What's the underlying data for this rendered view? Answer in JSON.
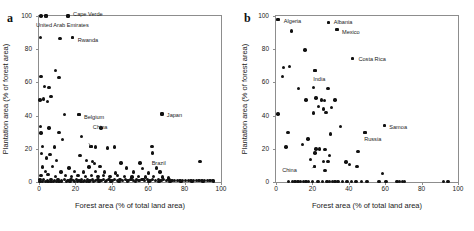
{
  "figure": {
    "panels": [
      {
        "letter": "a",
        "xlabel": "Forest area (% of total land area)",
        "ylabel": "Plantation area (% of forest area)",
        "xticks": [
          "0",
          "20",
          "40",
          "60",
          "80",
          "100"
        ],
        "yticks": [
          "0",
          "20",
          "40",
          "60",
          "80",
          "100"
        ],
        "annotations": [
          {
            "text": "Cape Verde"
          },
          {
            "text": "United Arab Emirates"
          },
          {
            "text": "Rwanda"
          },
          {
            "text": "Belgium"
          },
          {
            "text": "China"
          },
          {
            "text": "Japan"
          },
          {
            "text": "Brazil"
          }
        ]
      },
      {
        "letter": "b",
        "xlabel": "Forest area (% of total land area)",
        "ylabel": "Plantation area (% of forest area)",
        "xticks": [
          "0",
          "20",
          "40",
          "60",
          "80",
          "100"
        ],
        "yticks": [
          "0",
          "20",
          "40",
          "60",
          "80",
          "100"
        ],
        "annotations": [
          {
            "text": "Algeria"
          },
          {
            "text": "Albania"
          },
          {
            "text": "Mexico"
          },
          {
            "text": "Costa Rica"
          },
          {
            "text": "India"
          },
          {
            "text": "Samoa"
          },
          {
            "text": "Russia"
          },
          {
            "text": "China"
          }
        ]
      }
    ]
  },
  "chart_data": [
    {
      "type": "scatter",
      "title": "a",
      "xlabel": "Forest area (% of total land area)",
      "ylabel": "Plantation area (% of forest area)",
      "xlim": [
        0,
        100
      ],
      "ylim": [
        0,
        100
      ],
      "xticks": [
        0,
        20,
        40,
        60,
        80,
        100
      ],
      "yticks": [
        0,
        20,
        40,
        60,
        80,
        100
      ],
      "grid": false,
      "legend": null,
      "marker": "filled-circle",
      "marker_color": "#111111",
      "labeled_points": [
        {
          "label": "Cape Verde",
          "x": 16.0,
          "y": 100.0
        },
        {
          "label": "United Arab Emirates",
          "x": 3.8,
          "y": 100.0
        },
        {
          "label": "Rwanda",
          "x": 18.5,
          "y": 87.0
        },
        {
          "label": "Belgium",
          "x": 22.0,
          "y": 40.5
        },
        {
          "label": "China",
          "x": 28.5,
          "y": 21.5
        },
        {
          "label": "Japan",
          "x": 67.5,
          "y": 41.0
        },
        {
          "label": "Brazil",
          "x": 57.5,
          "y": 1.5
        }
      ],
      "points": [
        [
          1.0,
          100.0
        ],
        [
          3.8,
          100.0
        ],
        [
          16.0,
          100.0
        ],
        [
          0.8,
          87.0
        ],
        [
          11.5,
          86.5
        ],
        [
          18.5,
          87.0
        ],
        [
          1.0,
          63.5
        ],
        [
          11.0,
          63.0
        ],
        [
          9.0,
          67.0
        ],
        [
          3.0,
          57.5
        ],
        [
          5.5,
          57.0
        ],
        [
          2.5,
          50.0
        ],
        [
          6.5,
          51.5
        ],
        [
          0.6,
          49.5
        ],
        [
          4.5,
          48.5
        ],
        [
          14.0,
          40.5
        ],
        [
          22.0,
          40.5
        ],
        [
          67.5,
          41.0
        ],
        [
          0.8,
          33.5
        ],
        [
          5.5,
          32.5
        ],
        [
          11.0,
          30.0
        ],
        [
          1.2,
          29.5
        ],
        [
          23.5,
          27.5
        ],
        [
          34.0,
          32.5
        ],
        [
          13.0,
          25.5
        ],
        [
          2.0,
          21.5
        ],
        [
          8.5,
          21.0
        ],
        [
          28.5,
          21.5
        ],
        [
          31.0,
          21.0
        ],
        [
          37.5,
          20.5
        ],
        [
          41.5,
          21.0
        ],
        [
          62.0,
          21.5
        ],
        [
          1.5,
          17.0
        ],
        [
          6.0,
          16.5
        ],
        [
          22.5,
          16.0
        ],
        [
          62.5,
          17.5
        ],
        [
          4.0,
          14.5
        ],
        [
          9.5,
          13.0
        ],
        [
          26.0,
          13.0
        ],
        [
          29.5,
          12.5
        ],
        [
          30.5,
          11.0
        ],
        [
          45.0,
          11.5
        ],
        [
          55.5,
          11.5
        ],
        [
          88.5,
          12.5
        ],
        [
          2.0,
          9.0
        ],
        [
          7.5,
          9.5
        ],
        [
          16.5,
          8.5
        ],
        [
          27.5,
          9.0
        ],
        [
          33.5,
          9.5
        ],
        [
          48.0,
          8.5
        ],
        [
          57.0,
          8.0
        ],
        [
          64.5,
          8.5
        ],
        [
          3.5,
          6.5
        ],
        [
          12.0,
          6.0
        ],
        [
          19.5,
          6.5
        ],
        [
          24.5,
          6.0
        ],
        [
          31.0,
          6.5
        ],
        [
          36.0,
          6.0
        ],
        [
          42.0,
          5.5
        ],
        [
          52.0,
          6.0
        ],
        [
          60.0,
          5.5
        ],
        [
          66.5,
          6.0
        ],
        [
          1.0,
          4.0
        ],
        [
          5.0,
          4.5
        ],
        [
          9.0,
          3.5
        ],
        [
          14.5,
          4.0
        ],
        [
          18.0,
          3.5
        ],
        [
          21.5,
          4.0
        ],
        [
          25.5,
          3.5
        ],
        [
          29.0,
          4.0
        ],
        [
          32.5,
          3.5
        ],
        [
          35.5,
          4.0
        ],
        [
          39.0,
          3.5
        ],
        [
          43.0,
          4.0
        ],
        [
          47.0,
          3.5
        ],
        [
          51.0,
          3.0
        ],
        [
          54.5,
          3.5
        ],
        [
          58.5,
          3.0
        ],
        [
          63.0,
          3.5
        ],
        [
          68.0,
          3.0
        ],
        [
          71.0,
          2.5
        ],
        [
          0.5,
          1.5
        ],
        [
          2.5,
          1.5
        ],
        [
          4.5,
          1.0
        ],
        [
          6.5,
          1.5
        ],
        [
          8.5,
          1.0
        ],
        [
          10.5,
          1.5
        ],
        [
          12.5,
          1.0
        ],
        [
          14.0,
          1.5
        ],
        [
          16.0,
          1.0
        ],
        [
          17.5,
          1.5
        ],
        [
          19.0,
          1.0
        ],
        [
          20.5,
          1.5
        ],
        [
          22.0,
          1.0
        ],
        [
          23.5,
          1.5
        ],
        [
          25.0,
          1.0
        ],
        [
          26.5,
          1.5
        ],
        [
          28.0,
          1.0
        ],
        [
          29.5,
          1.5
        ],
        [
          31.0,
          1.0
        ],
        [
          32.5,
          1.5
        ],
        [
          34.0,
          1.0
        ],
        [
          35.5,
          1.5
        ],
        [
          37.0,
          1.0
        ],
        [
          38.5,
          1.5
        ],
        [
          40.0,
          1.0
        ],
        [
          41.5,
          1.5
        ],
        [
          43.0,
          1.0
        ],
        [
          44.5,
          1.5
        ],
        [
          46.0,
          1.0
        ],
        [
          47.5,
          1.5
        ],
        [
          49.0,
          1.0
        ],
        [
          50.5,
          1.5
        ],
        [
          52.0,
          1.0
        ],
        [
          53.5,
          1.5
        ],
        [
          55.0,
          1.0
        ],
        [
          56.5,
          1.5
        ],
        [
          57.5,
          1.5
        ],
        [
          58.0,
          1.0
        ],
        [
          59.5,
          1.5
        ],
        [
          61.0,
          1.0
        ],
        [
          62.5,
          1.5
        ],
        [
          64.0,
          1.0
        ],
        [
          65.5,
          1.5
        ],
        [
          67.0,
          1.0
        ],
        [
          68.5,
          1.5
        ],
        [
          70.0,
          1.0
        ],
        [
          71.5,
          1.5
        ],
        [
          73.0,
          1.0
        ],
        [
          74.5,
          0.8
        ],
        [
          76.0,
          1.0
        ],
        [
          77.5,
          0.8
        ],
        [
          79.0,
          1.0
        ],
        [
          80.5,
          0.8
        ],
        [
          82.0,
          1.0
        ],
        [
          83.5,
          0.8
        ],
        [
          85.0,
          1.0
        ],
        [
          86.5,
          0.8
        ],
        [
          88.0,
          1.0
        ],
        [
          89.5,
          0.8
        ],
        [
          91.0,
          1.0
        ],
        [
          92.5,
          0.8
        ],
        [
          94.0,
          1.0
        ],
        [
          95.5,
          0.8
        ],
        [
          0.5,
          0.3
        ],
        [
          2.0,
          0.3
        ],
        [
          3.5,
          0.3
        ],
        [
          5.0,
          0.3
        ],
        [
          6.5,
          0.3
        ],
        [
          8.0,
          0.3
        ],
        [
          9.5,
          0.3
        ],
        [
          11.0,
          0.3
        ],
        [
          12.5,
          0.3
        ],
        [
          15.0,
          0.3
        ],
        [
          17.0,
          0.3
        ],
        [
          19.5,
          0.3
        ],
        [
          21.0,
          0.3
        ],
        [
          23.0,
          0.3
        ],
        [
          24.5,
          0.3
        ],
        [
          26.0,
          0.3
        ],
        [
          27.5,
          0.3
        ],
        [
          30.0,
          0.3
        ],
        [
          33.0,
          0.3
        ],
        [
          36.5,
          0.3
        ],
        [
          39.5,
          0.3
        ],
        [
          44.0,
          0.3
        ],
        [
          48.5,
          0.3
        ],
        [
          53.0,
          0.3
        ],
        [
          60.5,
          0.3
        ],
        [
          66.0,
          0.3
        ],
        [
          72.0,
          0.3
        ],
        [
          78.0,
          0.3
        ],
        [
          84.0,
          0.3
        ],
        [
          90.0,
          0.3
        ],
        [
          96.0,
          0.3
        ]
      ]
    },
    {
      "type": "scatter",
      "title": "b",
      "xlabel": "Forest area (% of total land area)",
      "ylabel": "Plantation area (% of forest area)",
      "xlim": [
        0,
        100
      ],
      "ylim": [
        0,
        100
      ],
      "xticks": [
        0,
        20,
        40,
        60,
        80,
        100
      ],
      "yticks": [
        0,
        20,
        40,
        60,
        80,
        100
      ],
      "grid": false,
      "legend": null,
      "marker": "filled-circle",
      "marker_color": "#111111",
      "labeled_points": [
        {
          "label": "Algeria",
          "x": 1.0,
          "y": 98.0
        },
        {
          "label": "Albania",
          "x": 29.0,
          "y": 96.0
        },
        {
          "label": "Mexico",
          "x": 33.5,
          "y": 92.0
        },
        {
          "label": "Costa Rica",
          "x": 42.0,
          "y": 74.5
        },
        {
          "label": "India",
          "x": 21.5,
          "y": 67.0
        },
        {
          "label": "Samoa",
          "x": 59.5,
          "y": 34.0
        },
        {
          "label": "Russia",
          "x": 49.0,
          "y": 30.0
        },
        {
          "label": "China",
          "x": 21.0,
          "y": 9.5
        }
      ],
      "points": [
        [
          1.0,
          98.0
        ],
        [
          29.0,
          96.0
        ],
        [
          33.5,
          92.0
        ],
        [
          8.5,
          91.0
        ],
        [
          16.0,
          79.5
        ],
        [
          42.0,
          74.5
        ],
        [
          4.0,
          69.0
        ],
        [
          7.5,
          69.5
        ],
        [
          21.5,
          67.0
        ],
        [
          3.5,
          63.5
        ],
        [
          12.5,
          56.5
        ],
        [
          20.5,
          57.0
        ],
        [
          28.5,
          56.5
        ],
        [
          22.0,
          50.5
        ],
        [
          26.5,
          49.0
        ],
        [
          1.0,
          41.0
        ],
        [
          20.5,
          41.5
        ],
        [
          27.5,
          42.0
        ],
        [
          16.5,
          49.5
        ],
        [
          25.0,
          49.5
        ],
        [
          32.5,
          49.5
        ],
        [
          23.5,
          45.5
        ],
        [
          26.0,
          44.0
        ],
        [
          30.5,
          45.0
        ],
        [
          6.5,
          30.0
        ],
        [
          30.0,
          29.0
        ],
        [
          35.5,
          33.5
        ],
        [
          49.0,
          30.0
        ],
        [
          59.5,
          34.0
        ],
        [
          5.5,
          21.0
        ],
        [
          14.5,
          22.5
        ],
        [
          17.5,
          26.0
        ],
        [
          22.0,
          20.0
        ],
        [
          24.0,
          20.0
        ],
        [
          27.0,
          19.5
        ],
        [
          21.5,
          17.5
        ],
        [
          29.5,
          16.0
        ],
        [
          45.0,
          18.5
        ],
        [
          19.0,
          13.5
        ],
        [
          26.0,
          12.5
        ],
        [
          28.5,
          12.5
        ],
        [
          38.5,
          12.0
        ],
        [
          27.0,
          7.0
        ],
        [
          40.5,
          10.5
        ],
        [
          44.5,
          9.5
        ],
        [
          21.0,
          9.5
        ],
        [
          58.5,
          5.0
        ],
        [
          7.0,
          0.3
        ],
        [
          9.0,
          0.3
        ],
        [
          10.5,
          0.3
        ],
        [
          12.0,
          0.3
        ],
        [
          13.5,
          0.3
        ],
        [
          15.0,
          0.3
        ],
        [
          16.5,
          0.3
        ],
        [
          18.0,
          0.3
        ],
        [
          20.0,
          0.3
        ],
        [
          23.0,
          0.3
        ],
        [
          25.5,
          0.3
        ],
        [
          28.0,
          0.3
        ],
        [
          29.5,
          0.3
        ],
        [
          31.0,
          0.3
        ],
        [
          32.5,
          0.3
        ],
        [
          34.0,
          0.3
        ],
        [
          36.5,
          0.3
        ],
        [
          39.0,
          0.3
        ],
        [
          41.5,
          0.3
        ],
        [
          44.0,
          0.3
        ],
        [
          47.0,
          0.3
        ],
        [
          50.0,
          0.3
        ],
        [
          56.5,
          0.3
        ],
        [
          60.5,
          0.3
        ],
        [
          66.5,
          0.3
        ],
        [
          68.0,
          0.3
        ],
        [
          69.5,
          0.3
        ],
        [
          70.5,
          0.3
        ],
        [
          92.0,
          0.3
        ],
        [
          94.5,
          0.3
        ]
      ]
    }
  ]
}
